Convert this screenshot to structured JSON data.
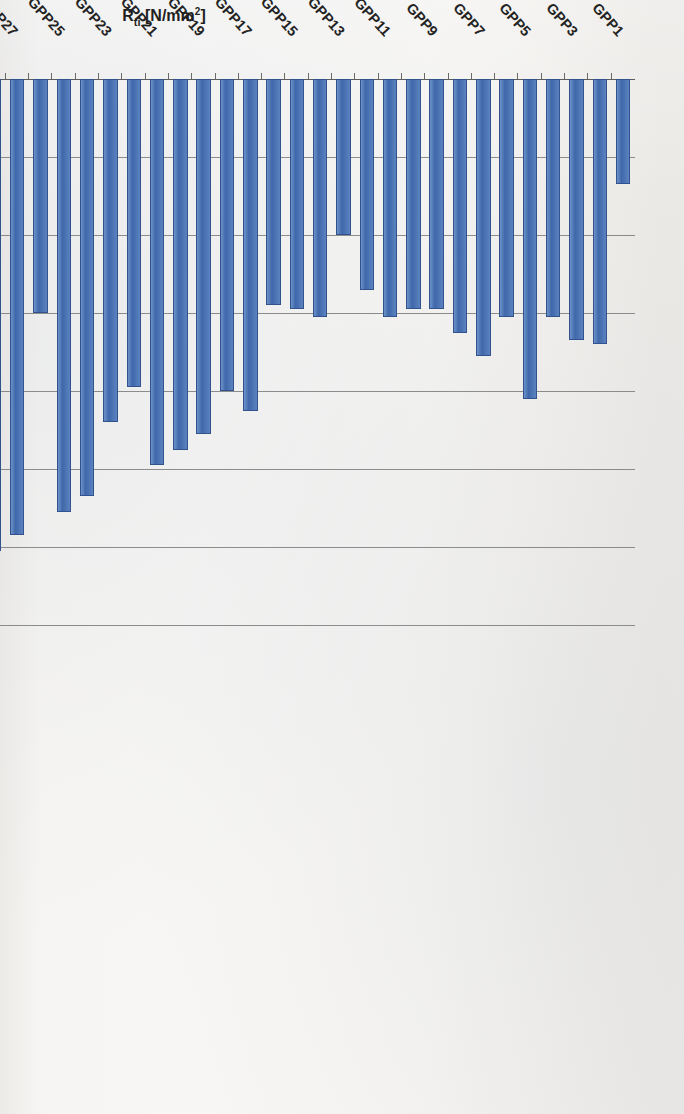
{
  "figure": {
    "kind": "scanned-bar-chart",
    "orientation": "rotated-90",
    "series_color": "#4a72b2",
    "border_color": "#31528c"
  },
  "axes": {
    "value_axis_label_prefix": "R",
    "value_axis_label_sub": "ti",
    "value_axis_label_unit": " [N/mm",
    "value_axis_label_sup": "2",
    "value_axis_label_close": "]",
    "value_axis_label_full": "Rti [N/mm2]",
    "category_axis_label": "Compoziții",
    "value_ticks": [
      "0",
      "1",
      "2",
      "3",
      "4",
      "5",
      "6",
      "7"
    ]
  },
  "chart_data": {
    "type": "bar",
    "title": "",
    "xlabel": "Compoziții",
    "ylabel": "Rti [N/mm2]",
    "ylim": [
      0,
      7
    ],
    "orientation": "horizontal-rotated",
    "grid": true,
    "legend": "none",
    "categories": [
      "GPP1",
      "GPP2",
      "GPP3",
      "GPP4",
      "GPP5",
      "GPP6",
      "GPP7",
      "GPP8",
      "GPP9",
      "GPP10",
      "GPP11",
      "GPP12",
      "GPP13",
      "GPP14",
      "GPP15",
      "GPP16",
      "GPP17",
      "GPP18",
      "GPP19",
      "GPP20",
      "GPP21",
      "GPP22",
      "GPP23",
      "GPP24",
      "GPP25",
      "GPP26",
      "GPP27",
      "GPP28",
      "GPP29",
      "GPP30",
      "GPP31",
      "GPP32",
      "GPP33",
      "GPP34",
      "GPP35",
      "GPP36",
      "GPP37",
      "GPP38",
      "GPP39",
      "GPP40",
      "GPP41",
      "GPP42",
      "GPP43"
    ],
    "tick_labels_shown": [
      "GPP1",
      "GPP3",
      "GPP5",
      "GPP7",
      "GPP9",
      "GPP11",
      "GPP13",
      "GPP15",
      "GPP17",
      "GPP19",
      "GPP21",
      "GPP23",
      "GPP25",
      "GPP27",
      "GPP29",
      "GPP31",
      "GPP33",
      "GPP35",
      "GPP37",
      "GPP39",
      "GPP41",
      "GPP43"
    ],
    "values": [
      1.35,
      3.4,
      3.35,
      3.05,
      4.1,
      3.05,
      3.55,
      3.25,
      2.95,
      2.95,
      3.05,
      2.7,
      2.0,
      3.05,
      2.95,
      2.9,
      4.25,
      4.0,
      4.55,
      4.75,
      4.95,
      3.95,
      4.4,
      5.35,
      5.55,
      3.0,
      5.85,
      6.05,
      6.55,
      2.1,
      2.6,
      1.55,
      3.1,
      3.25,
      3.1,
      3.25,
      3.2,
      3.25,
      1.85,
      3.25,
      3.35,
      2.95,
      2.4
    ]
  }
}
